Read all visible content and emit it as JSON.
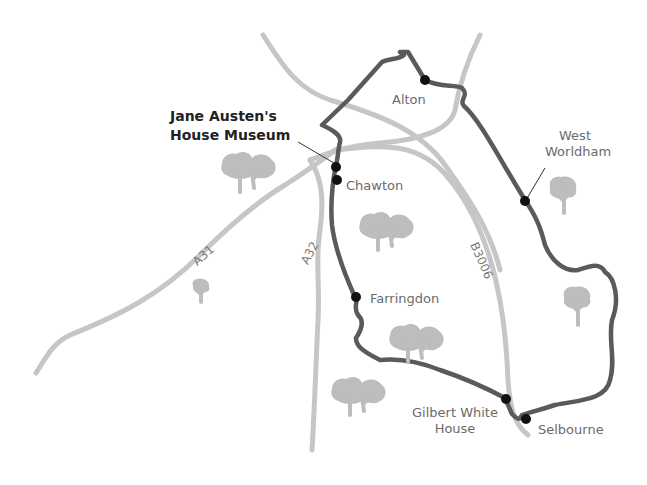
{
  "map": {
    "title_line1": "Jane Austen's",
    "title_line2": "House Museum",
    "places": {
      "alton": "Alton",
      "west_worldham_line1": "West",
      "west_worldham_line2": "Worldham",
      "chawton": "Chawton",
      "farringdon": "Farringdon",
      "gilbert_white_line1": "Gilbert White",
      "gilbert_white_line2": "House",
      "selbourne": "Selbourne"
    },
    "roads": {
      "a31": "A31",
      "a32": "A32",
      "b3006": "B3006"
    },
    "colors": {
      "route": "#5a5a5a",
      "road": "#c6c6c6",
      "tree": "#bdbdbd",
      "stop": "#111111"
    }
  }
}
